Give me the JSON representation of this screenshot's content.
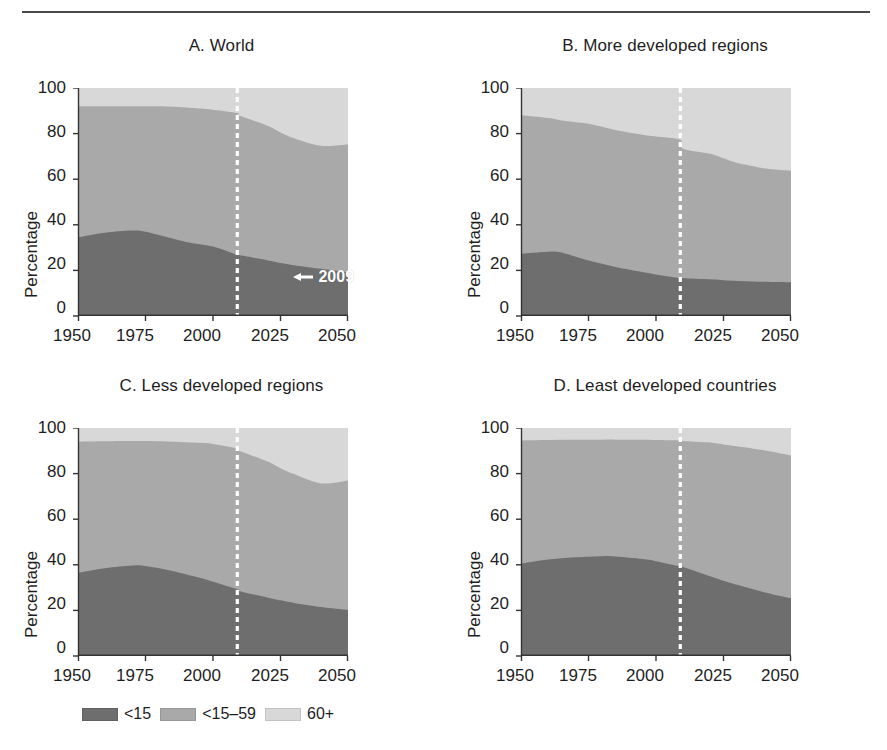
{
  "figure": {
    "top_rule": true,
    "background": "#ffffff"
  },
  "colors": {
    "series_under15": "#6e6e6e",
    "series_15_59": "#a9a9a9",
    "series_60plus": "#d8d8d8",
    "axis": "#333333",
    "text": "#1e1e1e",
    "marker_line": "#ffffff"
  },
  "axis": {
    "ylabel": "Percentage",
    "yticks": [
      "0",
      "20",
      "40",
      "60",
      "80",
      "100"
    ],
    "xticks": [
      "1950",
      "1975",
      "2000",
      "2025",
      "2050"
    ],
    "ylim": [
      0,
      100
    ],
    "xlim": [
      1950,
      2050
    ]
  },
  "legend": {
    "position": "bottom-left",
    "items": [
      {
        "label": "<15",
        "color": "#6e6e6e"
      },
      {
        "label": "<15–59",
        "color": "#a9a9a9"
      },
      {
        "label": "60+",
        "color": "#d8d8d8"
      }
    ]
  },
  "annotation": {
    "label": "2009",
    "arrow": "left-arrow-icon",
    "marker_year": 2009,
    "panel": "A"
  },
  "chart_data": [
    {
      "id": "A",
      "type": "area",
      "title": "A. World",
      "xlabel": "",
      "ylabel": "Percentage",
      "ylim": [
        0,
        100
      ],
      "xlim": [
        1950,
        2050
      ],
      "grid": false,
      "stacked": true,
      "marker_year": 2009,
      "marker_label": "2009",
      "x": [
        1950,
        1960,
        1970,
        1975,
        1980,
        1990,
        2000,
        2009,
        2010,
        2020,
        2025,
        2030,
        2040,
        2050
      ],
      "series": [
        {
          "name": "<15",
          "color": "#6e6e6e",
          "values": [
            34.5,
            36.5,
            37.5,
            37.0,
            35.5,
            32.5,
            30.5,
            26.8,
            26.6,
            24.5,
            23.3,
            22.3,
            20.7,
            19.2
          ]
        },
        {
          "name": "<15–59",
          "color": "#a9a9a9",
          "values": [
            57.5,
            55.5,
            54.5,
            55.0,
            56.5,
            59.0,
            60.0,
            62.2,
            61.2,
            59.0,
            57.2,
            55.5,
            54.0,
            56.0
          ]
        },
        {
          "name": "60+",
          "color": "#d8d8d8",
          "values": [
            8.0,
            8.0,
            8.0,
            8.0,
            8.0,
            8.5,
            9.5,
            11.0,
            12.2,
            16.5,
            19.5,
            22.2,
            25.3,
            24.8
          ]
        }
      ],
      "boundaries": {
        "under15_top": [
          34.5,
          36.5,
          37.5,
          37.0,
          35.5,
          32.5,
          30.5,
          26.8,
          26.6,
          24.5,
          23.3,
          22.3,
          20.7,
          19.2
        ],
        "mid_top": [
          92.0,
          92.0,
          92.0,
          92.0,
          92.0,
          91.5,
          90.5,
          89.0,
          87.8,
          83.5,
          80.5,
          78.0,
          74.7,
          75.2
        ]
      }
    },
    {
      "id": "B",
      "type": "area",
      "title": "B. More developed regions",
      "xlabel": "",
      "ylabel": "Percentage",
      "ylim": [
        0,
        100
      ],
      "xlim": [
        1950,
        2050
      ],
      "grid": false,
      "stacked": true,
      "marker_year": 2009,
      "x": [
        1950,
        1960,
        1965,
        1975,
        1985,
        1995,
        2000,
        2009,
        2010,
        2020,
        2025,
        2030,
        2040,
        2050
      ],
      "series": [
        {
          "name": "<15",
          "color": "#6e6e6e",
          "values": [
            27.3,
            28.2,
            27.8,
            24.3,
            21.5,
            19.3,
            18.2,
            16.6,
            16.6,
            16.1,
            15.7,
            15.4,
            15.0,
            14.8
          ]
        },
        {
          "name": "<15–59",
          "color": "#a9a9a9",
          "values": [
            60.7,
            58.6,
            58.0,
            60.0,
            60.1,
            60.2,
            60.5,
            60.7,
            56.8,
            55.1,
            53.5,
            51.8,
            49.8,
            48.9
          ]
        },
        {
          "name": "60+",
          "color": "#d8d8d8",
          "values": [
            12.0,
            13.2,
            14.2,
            15.7,
            18.4,
            20.5,
            21.3,
            22.7,
            26.6,
            28.8,
            30.8,
            32.8,
            35.2,
            36.3
          ]
        }
      ],
      "boundaries": {
        "under15_top": [
          27.3,
          28.2,
          27.8,
          24.3,
          21.5,
          19.3,
          18.2,
          16.6,
          16.6,
          16.1,
          15.7,
          15.4,
          15.0,
          14.8
        ],
        "mid_top": [
          88.0,
          86.8,
          85.8,
          84.3,
          81.6,
          79.5,
          78.7,
          77.3,
          73.4,
          71.2,
          69.2,
          67.2,
          64.8,
          63.7
        ]
      }
    },
    {
      "id": "C",
      "type": "area",
      "title": "C. Less developed regions",
      "xlabel": "",
      "ylabel": "Percentage",
      "ylim": [
        0,
        100
      ],
      "xlim": [
        1950,
        2050
      ],
      "grid": false,
      "stacked": true,
      "marker_year": 2009,
      "x": [
        1950,
        1960,
        1970,
        1975,
        1985,
        1995,
        2000,
        2009,
        2010,
        2020,
        2025,
        2030,
        2040,
        2050
      ],
      "series": [
        {
          "name": "<15",
          "color": "#6e6e6e",
          "values": [
            36.5,
            38.5,
            39.7,
            39.5,
            37.3,
            34.3,
            32.6,
            29.3,
            28.4,
            25.7,
            24.4,
            23.3,
            21.5,
            20.2
          ]
        },
        {
          "name": "<15–59",
          "color": "#a9a9a9",
          "values": [
            57.5,
            55.7,
            54.6,
            54.8,
            56.7,
            59.2,
            60.4,
            61.7,
            61.5,
            59.7,
            58.0,
            56.5,
            54.2,
            56.8
          ]
        },
        {
          "name": "60+",
          "color": "#d8d8d8",
          "values": [
            6.0,
            5.8,
            5.7,
            5.7,
            6.0,
            6.5,
            7.0,
            9.0,
            10.1,
            14.6,
            17.6,
            20.2,
            24.3,
            23.0
          ]
        }
      ],
      "boundaries": {
        "under15_top": [
          36.5,
          38.5,
          39.7,
          39.5,
          37.3,
          34.3,
          32.6,
          29.3,
          28.4,
          25.7,
          24.4,
          23.3,
          21.5,
          20.2
        ],
        "mid_top": [
          94.0,
          94.2,
          94.3,
          94.3,
          94.0,
          93.5,
          93.0,
          91.0,
          89.9,
          85.4,
          82.4,
          79.8,
          75.7,
          77.0
        ]
      }
    },
    {
      "id": "D",
      "type": "area",
      "title": "D. Least developed countries",
      "xlabel": "",
      "ylabel": "Percentage",
      "ylim": [
        0,
        100
      ],
      "xlim": [
        1950,
        2050
      ],
      "grid": false,
      "stacked": true,
      "marker_year": 2009,
      "x": [
        1950,
        1960,
        1970,
        1980,
        1985,
        1995,
        2000,
        2009,
        2010,
        2020,
        2025,
        2030,
        2040,
        2050
      ],
      "series": [
        {
          "name": "<15",
          "color": "#6e6e6e",
          "values": [
            40.5,
            42.3,
            43.3,
            43.8,
            43.6,
            42.5,
            41.6,
            39.3,
            39.0,
            35.0,
            33.0,
            31.2,
            28.0,
            25.3
          ]
        },
        {
          "name": "<15–59",
          "color": "#a9a9a9",
          "values": [
            54.0,
            52.4,
            51.5,
            51.1,
            51.3,
            52.3,
            53.1,
            55.2,
            55.3,
            58.6,
            59.8,
            60.8,
            62.2,
            62.6
          ]
        },
        {
          "name": "60+",
          "color": "#d8d8d8",
          "values": [
            5.5,
            5.3,
            5.2,
            5.1,
            5.1,
            5.2,
            5.3,
            5.5,
            5.7,
            6.4,
            7.2,
            8.0,
            9.8,
            12.1
          ]
        }
      ],
      "boundaries": {
        "under15_top": [
          40.5,
          42.3,
          43.3,
          43.8,
          43.6,
          42.5,
          41.6,
          39.3,
          39.0,
          35.0,
          33.0,
          31.2,
          28.0,
          25.3
        ],
        "mid_top": [
          94.5,
          94.7,
          94.8,
          94.9,
          94.9,
          94.8,
          94.7,
          94.5,
          94.3,
          93.6,
          92.8,
          92.0,
          90.2,
          87.9
        ]
      }
    }
  ]
}
